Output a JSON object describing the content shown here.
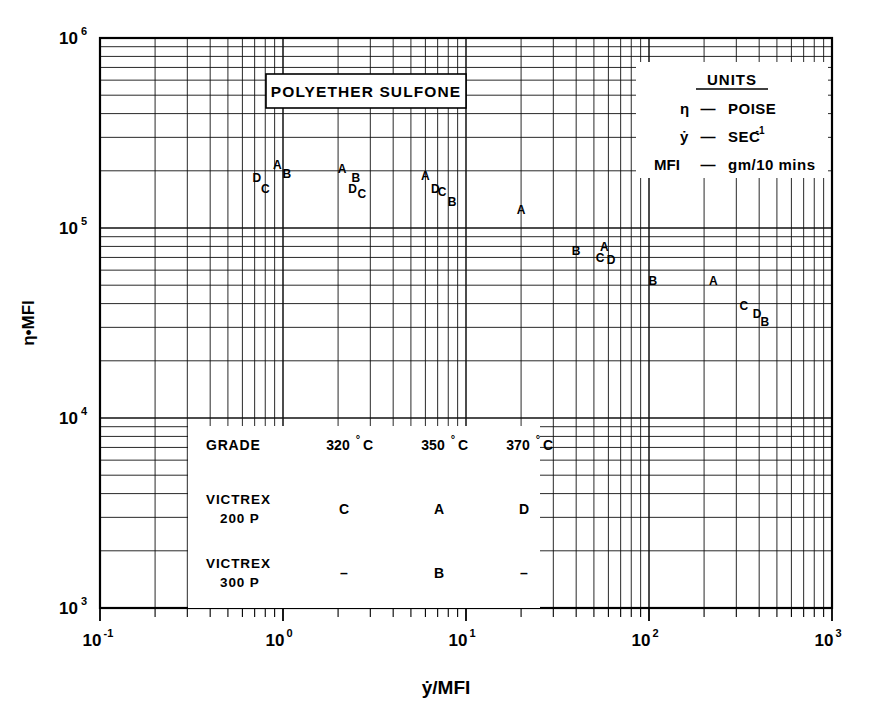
{
  "chart_data": {
    "type": "scatter",
    "title": "POLYETHER SULFONE",
    "xlabel": "ẏ/MFI",
    "ylabel": "η•MFI",
    "xscale": "log",
    "yscale": "log",
    "xlim": [
      0.1,
      1000
    ],
    "ylim": [
      1000,
      1000000
    ],
    "xticks": [
      "10",
      "10",
      "10",
      "10",
      "10"
    ],
    "xtick_exponents": [
      "-1",
      "0",
      "1",
      "2",
      "3"
    ],
    "yticks": [
      "10",
      "10",
      "10",
      "10"
    ],
    "ytick_exponents": [
      "3",
      "4",
      "5",
      "6"
    ],
    "grid": "log-log minor gridlines",
    "legend_position": "none",
    "points": [
      {
        "label": "D",
        "x": 0.72,
        "y": 175000,
        "sub": false
      },
      {
        "label": "C",
        "x": 0.8,
        "y": 152000,
        "sub": true
      },
      {
        "label": "A",
        "x": 0.93,
        "y": 205000,
        "sub": false
      },
      {
        "label": "B",
        "x": 1.05,
        "y": 183000,
        "sub": false
      },
      {
        "label": "A",
        "x": 2.1,
        "y": 195000,
        "sub": false
      },
      {
        "label": "B",
        "x": 2.5,
        "y": 175000,
        "sub": false
      },
      {
        "label": "D",
        "x": 2.4,
        "y": 152000,
        "sub": false
      },
      {
        "label": "C",
        "x": 2.7,
        "y": 143000,
        "sub": true
      },
      {
        "label": "A",
        "x": 6.0,
        "y": 178000,
        "sub": false
      },
      {
        "label": "D",
        "x": 6.8,
        "y": 152000,
        "sub": false
      },
      {
        "label": "C",
        "x": 7.4,
        "y": 148000,
        "sub": false
      },
      {
        "label": "B",
        "x": 8.4,
        "y": 130000,
        "sub": false
      },
      {
        "label": "A",
        "x": 20.0,
        "y": 118000,
        "sub": false
      },
      {
        "label": "B",
        "x": 40.0,
        "y": 72000,
        "sub": false
      },
      {
        "label": "A",
        "x": 57.0,
        "y": 76000,
        "sub": false
      },
      {
        "label": "C",
        "x": 54.0,
        "y": 66000,
        "sub": false
      },
      {
        "label": "D",
        "x": 62.0,
        "y": 65000,
        "sub": false
      },
      {
        "label": "B",
        "x": 105.0,
        "y": 50000,
        "sub": false
      },
      {
        "label": "A",
        "x": 225.0,
        "y": 50000,
        "sub": false
      },
      {
        "label": "C",
        "x": 330.0,
        "y": 37000,
        "sub": false
      },
      {
        "label": "D",
        "x": 390.0,
        "y": 33500,
        "sub": false
      },
      {
        "label": "B",
        "x": 430.0,
        "y": 30500,
        "sub": false
      }
    ]
  },
  "title_box": {
    "text": "POLYETHER SULFONE"
  },
  "units_box": {
    "heading": "UNITS",
    "rows": [
      {
        "symbol": "η",
        "dash": "—",
        "value": "POISE",
        "sup": ""
      },
      {
        "symbol": "ẏ",
        "dash": "—",
        "value": "SEC",
        "sup": "-1"
      },
      {
        "symbol": "MFI",
        "dash": "—",
        "value": "gm/10 mins",
        "sup": ""
      }
    ]
  },
  "grade_table": {
    "header": [
      "GRADE",
      "320",
      "350",
      "370"
    ],
    "header_unit": "C",
    "header_degree": "°",
    "rows": [
      {
        "name_line1": "VICTREX",
        "name_line2": "200 P",
        "c320": "C",
        "c350": "A",
        "c370": "D"
      },
      {
        "name_line1": "VICTREX",
        "name_line2": "300 P",
        "c320": "–",
        "c350": "B",
        "c370": "–"
      }
    ]
  },
  "axes": {
    "y_title": "η•MFI",
    "x_title": "ẏ/MFI"
  }
}
